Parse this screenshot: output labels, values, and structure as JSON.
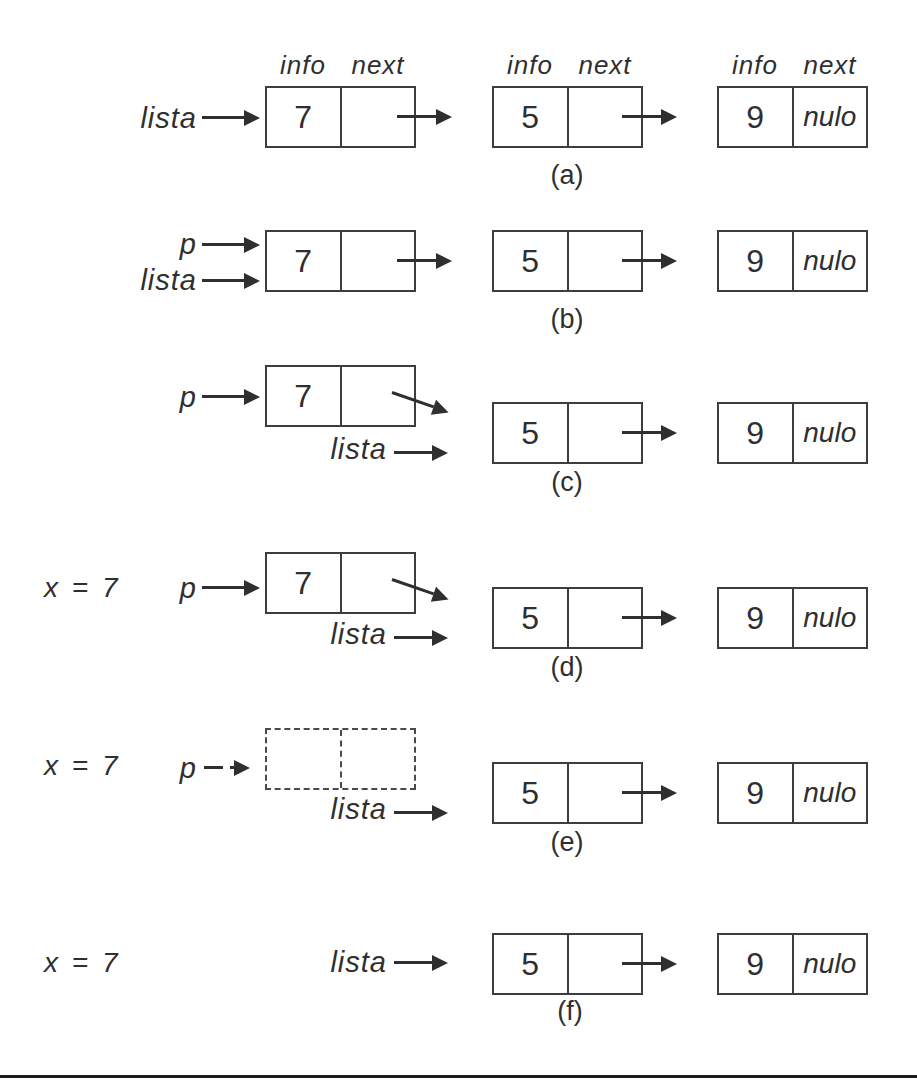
{
  "colors": {
    "ink": "#2f2f2f",
    "box_border": "#3d3d3d",
    "bottom_rule": "#1c1c1c",
    "background": "#ffffff"
  },
  "column_headers": {
    "info": "info",
    "next": "next"
  },
  "pointer_labels": {
    "lista": "lista",
    "p": "p"
  },
  "assignment_label": "x = 7",
  "node_values": {
    "first": "7",
    "second": "5",
    "third": "9"
  },
  "null_label": "nulo",
  "rows": [
    {
      "caption": "(a)"
    },
    {
      "caption": "(b)"
    },
    {
      "caption": "(c)"
    },
    {
      "caption": "(d)"
    },
    {
      "caption": "(e)"
    },
    {
      "caption": "(f)"
    }
  ]
}
